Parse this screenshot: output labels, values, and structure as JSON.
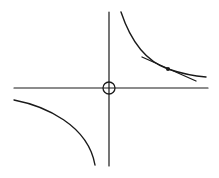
{
  "diagram": {
    "colors": {
      "background": "#ffffff",
      "stroke": "#1a1a1a"
    },
    "axes": {
      "x_axis": {
        "x1": 14,
        "y1": 88,
        "x2": 208,
        "y2": 88
      },
      "y_axis": {
        "x1": 109,
        "y1": 12,
        "x2": 109,
        "y2": 166
      }
    },
    "origin_marker": {
      "cx": 109,
      "cy": 88,
      "r": 6
    },
    "branches": {
      "upper_right": "M121,12 C132,45 148,62 168,69 C180,73 193,76 206,77",
      "lower_left": "M14,100 C45,106 88,125 95,165"
    },
    "tangent_line": {
      "x1": 142,
      "y1": 57,
      "x2": 196,
      "y2": 81
    },
    "tangent_point": {
      "cx": 168,
      "cy": 69,
      "r": 2
    }
  }
}
